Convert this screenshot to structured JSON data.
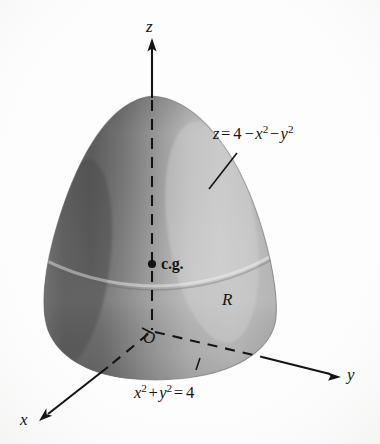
{
  "figure": {
    "background_color": "#fdfdfd",
    "surface": {
      "highlight_color": "#c9c9c9",
      "midtone_color": "#a8a8a8",
      "shadow_color": "#5f5f5f",
      "base_tone_color": "#b6b6b6",
      "outline_color": "#6e6e6e"
    },
    "ink_color": "#141414"
  },
  "axes": {
    "z": {
      "label": "z",
      "direction": "up"
    },
    "y": {
      "label": "y",
      "direction": "lower-right"
    },
    "x": {
      "label": "x",
      "direction": "lower-left"
    }
  },
  "labels": {
    "surface_equation": {
      "name": "surface-equation",
      "lhs": "z",
      "equals": "=",
      "const": "4",
      "minus1": "−",
      "x_var": "x",
      "x_pow": "2",
      "minus2": "−",
      "y_var": "y",
      "y_pow": "2",
      "full_text": "z = 4 − x2 − y2"
    },
    "base_equation": {
      "name": "base-equation",
      "x_var": "x",
      "x_pow": "2",
      "plus": "+",
      "y_var": "y",
      "y_pow": "2",
      "equals": "=",
      "rhs": "4",
      "full_text": "x2 + y2 = 4"
    },
    "center_of_gravity": "c.g.",
    "origin": "O",
    "region": "R"
  }
}
